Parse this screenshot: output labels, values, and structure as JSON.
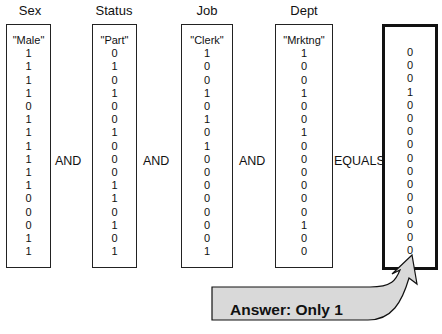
{
  "columns": [
    {
      "header": "Sex",
      "label": "\"Male\"",
      "values": [
        1,
        1,
        1,
        1,
        0,
        1,
        1,
        1,
        1,
        1,
        1,
        0,
        0,
        0,
        1,
        1
      ]
    },
    {
      "header": "Status",
      "label": "\"Part\"",
      "values": [
        0,
        1,
        0,
        1,
        0,
        0,
        1,
        0,
        0,
        0,
        1,
        1,
        0,
        1,
        0,
        1
      ]
    },
    {
      "header": "Job",
      "label": "\"Clerk\"",
      "values": [
        1,
        0,
        0,
        1,
        0,
        1,
        0,
        1,
        0,
        0,
        0,
        0,
        0,
        0,
        0,
        1
      ]
    },
    {
      "header": "Dept",
      "label": "\"Mrktng\"",
      "values": [
        1,
        0,
        0,
        1,
        0,
        0,
        1,
        0,
        0,
        0,
        0,
        0,
        0,
        1,
        0,
        0
      ]
    }
  ],
  "result": {
    "values": [
      0,
      0,
      0,
      1,
      0,
      0,
      0,
      0,
      0,
      0,
      0,
      0,
      0,
      0,
      0,
      0
    ]
  },
  "operators": [
    "AND",
    "AND",
    "AND",
    "EQUALS"
  ],
  "answer": "Answer:  Only 1",
  "colors": {
    "arrow_fill": "#d9d9d9",
    "border": "#111111"
  }
}
